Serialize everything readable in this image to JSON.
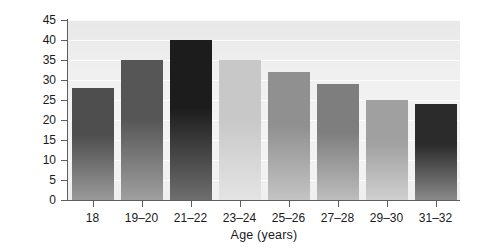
{
  "chart_data": {
    "type": "bar",
    "title": "",
    "xlabel": "Age (years)",
    "ylabel": "Percent",
    "categories": [
      "18",
      "19–20",
      "21–22",
      "23–24",
      "25–26",
      "27–28",
      "29–30",
      "31–32"
    ],
    "values": [
      28,
      35,
      40,
      35,
      32,
      29,
      25,
      24
    ],
    "ylim": [
      0,
      45
    ],
    "yticks": [
      0,
      5,
      10,
      15,
      20,
      25,
      30,
      35,
      40,
      45
    ],
    "ytick_labels": [
      "0",
      "5",
      "10",
      "15",
      "20",
      "25",
      "30",
      "35",
      "40",
      "45"
    ],
    "grid": true,
    "legend": "none",
    "bar_colors": [
      "#4e4e4e",
      "#565656",
      "#1c1c1c",
      "#c8c8c8",
      "#909090",
      "#7e7e7e",
      "#a0a0a0",
      "#2b2b2b"
    ],
    "bar_bottom_colors": [
      "#9a9a9a",
      "#9f9f9f",
      "#6e6e6e",
      "#e4e4e4",
      "#c4c4c4",
      "#bdbdbd",
      "#cfcfcf",
      "#8a8a8a"
    ],
    "plot_background": "#f1f1f1",
    "axis_color": "#5d5d5d",
    "text_color": "#1a1a1a"
  }
}
